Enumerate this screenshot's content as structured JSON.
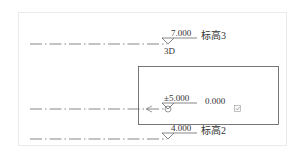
{
  "levels": [
    {
      "id": "level-3",
      "elevation": "7.000",
      "name": "标高3",
      "view_tag": "3D"
    },
    {
      "id": "level-1",
      "elevation": "±5.000",
      "offset_value": "0.000"
    },
    {
      "id": "level-2",
      "elevation": "4.000",
      "name": "标高2"
    }
  ],
  "colors": {
    "line": "#555555",
    "frame": "#ebebeb",
    "text": "#333333"
  }
}
